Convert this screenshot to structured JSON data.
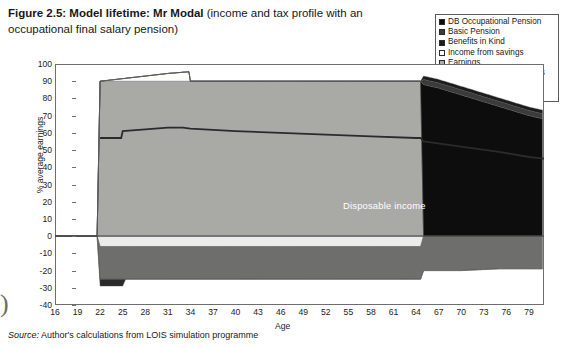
{
  "figure": {
    "title_bold": "Figure 2.5: Model lifetime: Mr Modal",
    "title_rest": " (income and tax profile with an occupational final salary pension)",
    "source_label": "Source:",
    "source_text": " Author's calculations from LOIS simulation programme",
    "page_curl_glyph": ")"
  },
  "legend": {
    "items": [
      {
        "label": "DB Occupational Pension",
        "color": "#0d0d0d"
      },
      {
        "label": "Basic Pension",
        "color": "#3b3b3b"
      },
      {
        "label": "Benefits in Kind",
        "color": "#1c1c1c"
      },
      {
        "label": "Income from savings",
        "color": "#fdfdfb"
      },
      {
        "label": "Earnings",
        "color": "#a9a9a6"
      },
      {
        "label": "Student Loan Repayments",
        "color": "#2a2a2a"
      },
      {
        "label": "Income Tax",
        "color": "#6e6e6c"
      },
      {
        "label": "NI",
        "color": "#ececea"
      }
    ]
  },
  "chart_data": {
    "type": "area",
    "title": "Model lifetime: Mr Modal (income and tax profile with an occupational final salary pension)",
    "xlabel": "Age",
    "ylabel": "% average earnings",
    "xlim": [
      16,
      81
    ],
    "ylim": [
      -40,
      100
    ],
    "ytick_step": 10,
    "xtick_step": 3,
    "grid": false,
    "legend_position": "top-right",
    "xticks": [
      16,
      19,
      22,
      25,
      28,
      31,
      34,
      37,
      40,
      43,
      46,
      49,
      52,
      55,
      58,
      61,
      64,
      67,
      70,
      73,
      76,
      79
    ],
    "yticks": [
      -40,
      -30,
      -20,
      -10,
      0,
      10,
      20,
      30,
      40,
      50,
      60,
      70,
      80,
      90,
      100
    ],
    "annotations": [
      {
        "text": "Disposable income",
        "x": 44,
        "y": 53
      }
    ],
    "series": [
      {
        "name": "Earnings",
        "color": "#a9a9a6",
        "stack": "positive",
        "x": [
          16,
          21.6,
          22,
          25,
          28,
          31,
          34,
          37,
          40,
          46,
          52,
          58,
          64,
          64.6,
          65,
          81
        ],
        "values": [
          0,
          0,
          90,
          90,
          90,
          90,
          90,
          90,
          90,
          90,
          90,
          90,
          90,
          90,
          0,
          0
        ]
      },
      {
        "name": "Income from savings",
        "color": "#fdfdfb",
        "stack": "positive",
        "x": [
          16,
          21.6,
          22,
          25,
          28,
          31,
          33.8,
          34,
          37,
          46,
          58,
          64,
          64.6,
          65,
          81
        ],
        "values": [
          0,
          0,
          0,
          1.5,
          3,
          4.5,
          5.5,
          0,
          0,
          0,
          0,
          0,
          0,
          0,
          0
        ]
      },
      {
        "name": "DB Occupational Pension",
        "color": "#0d0d0d",
        "stack": "positive",
        "x": [
          16,
          64.6,
          65,
          67,
          70,
          73,
          76,
          79,
          81
        ],
        "values": [
          0,
          0,
          88,
          86,
          82,
          78,
          74,
          70,
          68
        ]
      },
      {
        "name": "Basic Pension",
        "color": "#3b3b3b",
        "stack": "positive",
        "x": [
          16,
          64.6,
          65,
          70,
          75,
          81
        ],
        "values": [
          0,
          0,
          3,
          3,
          3,
          3
        ]
      },
      {
        "name": "Benefits in Kind",
        "color": "#1c1c1c",
        "stack": "positive",
        "x": [
          16,
          64.6,
          65,
          70,
          75,
          81
        ],
        "values": [
          0,
          0,
          2,
          2,
          2,
          2
        ]
      },
      {
        "name": "NI",
        "color": "#ececea",
        "stack": "negative",
        "x": [
          16,
          21.6,
          22,
          30,
          40,
          50,
          60,
          64,
          64.6,
          65,
          81
        ],
        "values": [
          0,
          0,
          -6,
          -6,
          -6,
          -6,
          -6,
          -6,
          -6,
          0,
          0
        ]
      },
      {
        "name": "Income Tax",
        "color": "#6e6e6c",
        "stack": "negative",
        "x": [
          16,
          21.6,
          22,
          25,
          31,
          37,
          43,
          49,
          55,
          61,
          64,
          64.6,
          65,
          70,
          75,
          81
        ],
        "values": [
          0,
          0,
          -19,
          -19,
          -19,
          -19,
          -19,
          -19,
          -19,
          -19,
          -19,
          -19,
          -20,
          -20,
          -19,
          -19
        ]
      },
      {
        "name": "Student Loan Repayments",
        "color": "#2a2a2a",
        "stack": "negative",
        "x": [
          16,
          21.6,
          22,
          25,
          25.4,
          31,
          81
        ],
        "values": [
          0,
          0,
          -4,
          -4,
          0,
          0,
          0
        ]
      },
      {
        "name": "Disposable income",
        "type": "line",
        "color": "#2b2b2b",
        "x": [
          22,
          24.8,
          25,
          28,
          31,
          33,
          34,
          40,
          46,
          52,
          58,
          64,
          64.6,
          65,
          70,
          75,
          79,
          81
        ],
        "values": [
          57,
          57,
          61,
          62,
          63,
          63,
          62.5,
          61,
          60,
          59,
          58,
          57,
          57,
          55,
          52,
          49,
          46,
          45
        ]
      }
    ]
  }
}
